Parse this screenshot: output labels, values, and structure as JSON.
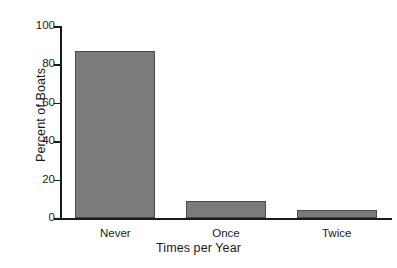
{
  "chart_data": {
    "type": "bar",
    "title": "",
    "categories": [
      "Never",
      "Once",
      "Twice"
    ],
    "values": [
      87,
      9,
      4
    ],
    "xlabel": "Times per Year",
    "ylabel": "Percent of Boats",
    "ylim": [
      0,
      100
    ],
    "yticks": [
      0,
      20,
      40,
      60,
      80,
      100
    ],
    "ytick_labels": [
      "0",
      "20",
      "40",
      "60",
      "80",
      "100"
    ],
    "grid": false,
    "legend": "none",
    "bar_color": "#7b7b7b",
    "bar_edge_color": "#4a4a4a",
    "axis_color": "#1a1a1a",
    "background_color": "#ffffff"
  },
  "axes": {
    "y_title": "Percent of Boats",
    "x_title": "Times per Year"
  }
}
